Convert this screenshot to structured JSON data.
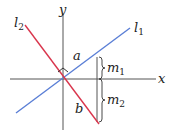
{
  "diagram": {
    "axes": {
      "x_label": "x",
      "y_label": "y"
    },
    "lines": [
      {
        "name": "l",
        "sub": "1",
        "color": "#5b7fd6"
      },
      {
        "name": "l",
        "sub": "2",
        "color": "#d9364d"
      }
    ],
    "segments": {
      "a": "a",
      "b": "b"
    },
    "braces": [
      {
        "name": "m",
        "sub": "1"
      },
      {
        "name": "m",
        "sub": "2"
      }
    ],
    "right_angle_marker": true
  }
}
